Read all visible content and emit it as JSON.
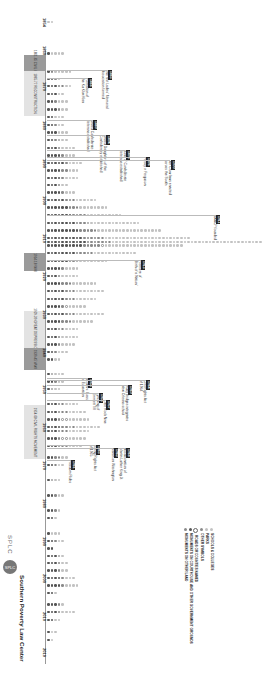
{
  "chart_data": {
    "type": "dot-timeline",
    "orientation": "rotated 90deg clockwise; year axis runs top-to-bottom, dot counts extend right",
    "xlabel": "Year",
    "ylabel": "Number of dedications",
    "x_range": [
      1854,
      2019
    ],
    "ticks": [
      "1854",
      "1860",
      "1870",
      "1880",
      "1890",
      "1900",
      "1910",
      "1920",
      "1930",
      "1940",
      "1950",
      "1960",
      "1970",
      "1980",
      "1990",
      "2000",
      "2010",
      "2019"
    ],
    "eras": [
      {
        "label": "1861-65 Civil War",
        "start": 1861,
        "end": 1865,
        "shade": "dark"
      },
      {
        "label": "1865-77 Reconstruction",
        "start": 1865,
        "end": 1877,
        "shade": "light"
      },
      {
        "label": "1914-18 WWI",
        "start": 1914,
        "end": 1918,
        "shade": "dark"
      },
      {
        "label": "1929-39 Great Depression",
        "start": 1929,
        "end": 1939,
        "shade": "light"
      },
      {
        "label": "1939-45 WWII",
        "start": 1939,
        "end": 1945,
        "shade": "dark"
      },
      {
        "label": "1954-68 Civil Rights Movement",
        "start": 1954,
        "end": 1968,
        "shade": "light"
      }
    ],
    "series": [
      {
        "name": "Schools and colleges",
        "color": "#c2c2c2"
      },
      {
        "name": "Parks",
        "color": "#c2c2c2"
      },
      {
        "name": "Other symbols",
        "color": "#8a8a8a"
      },
      {
        "name": "Roads or counties named",
        "color": "#ffffff"
      },
      {
        "name": "Monuments on courthouse and other government grounds",
        "color": "#555555"
      },
      {
        "name": "Monuments on other land",
        "color": "#8a8a8a"
      }
    ],
    "rows": [
      {
        "year": 1854,
        "dark": 0,
        "mid": 0,
        "light": 2,
        "open": 0
      },
      {
        "year": 1861,
        "dark": 1,
        "mid": 0,
        "light": 4,
        "open": 0
      },
      {
        "year": 1866,
        "dark": 1,
        "mid": 1,
        "light": 5,
        "open": 0
      },
      {
        "year": 1868,
        "dark": 2,
        "mid": 1,
        "light": 1,
        "open": 0
      },
      {
        "year": 1870,
        "dark": 3,
        "mid": 1,
        "light": 2,
        "open": 1
      },
      {
        "year": 1872,
        "dark": 3,
        "mid": 0,
        "light": 2,
        "open": 0
      },
      {
        "year": 1874,
        "dark": 2,
        "mid": 1,
        "light": 3,
        "open": 0
      },
      {
        "year": 1876,
        "dark": 3,
        "mid": 1,
        "light": 2,
        "open": 0
      },
      {
        "year": 1878,
        "dark": 2,
        "mid": 0,
        "light": 3,
        "open": 0
      },
      {
        "year": 1880,
        "dark": 2,
        "mid": 1,
        "light": 2,
        "open": 0
      },
      {
        "year": 1882,
        "dark": 3,
        "mid": 0,
        "light": 3,
        "open": 0
      },
      {
        "year": 1884,
        "dark": 2,
        "mid": 1,
        "light": 2,
        "open": 1
      },
      {
        "year": 1886,
        "dark": 3,
        "mid": 1,
        "light": 4,
        "open": 0
      },
      {
        "year": 1888,
        "dark": 4,
        "mid": 1,
        "light": 3,
        "open": 0
      },
      {
        "year": 1890,
        "dark": 5,
        "mid": 1,
        "light": 4,
        "open": 0
      },
      {
        "year": 1892,
        "dark": 4,
        "mid": 2,
        "light": 3,
        "open": 0
      },
      {
        "year": 1894,
        "dark": 4,
        "mid": 1,
        "light": 4,
        "open": 0
      },
      {
        "year": 1896,
        "dark": 3,
        "mid": 1,
        "light": 2,
        "open": 0
      },
      {
        "year": 1898,
        "dark": 4,
        "mid": 1,
        "light": 3,
        "open": 0
      },
      {
        "year": 1900,
        "dark": 5,
        "mid": 2,
        "light": 6,
        "open": 1
      },
      {
        "year": 1902,
        "dark": 6,
        "mid": 2,
        "light": 8,
        "open": 1
      },
      {
        "year": 1904,
        "dark": 7,
        "mid": 3,
        "light": 10,
        "open": 1
      },
      {
        "year": 1906,
        "dark": 8,
        "mid": 3,
        "light": 14,
        "open": 1
      },
      {
        "year": 1908,
        "dark": 9,
        "mid": 4,
        "light": 18,
        "open": 1
      },
      {
        "year": 1910,
        "dark": 10,
        "mid": 5,
        "light": 24,
        "open": 1
      },
      {
        "year": 1911,
        "dark": 11,
        "mid": 6,
        "light": 48,
        "open": 1
      },
      {
        "year": 1912,
        "dark": 10,
        "mid": 5,
        "light": 22,
        "open": 1
      },
      {
        "year": 1914,
        "dark": 8,
        "mid": 4,
        "light": 12,
        "open": 1
      },
      {
        "year": 1916,
        "dark": 6,
        "mid": 2,
        "light": 8,
        "open": 1
      },
      {
        "year": 1918,
        "dark": 4,
        "mid": 1,
        "light": 4,
        "open": 0
      },
      {
        "year": 1920,
        "dark": 3,
        "mid": 1,
        "light": 5,
        "open": 0
      },
      {
        "year": 1922,
        "dark": 4,
        "mid": 2,
        "light": 7,
        "open": 1
      },
      {
        "year": 1924,
        "dark": 5,
        "mid": 2,
        "light": 8,
        "open": 1
      },
      {
        "year": 1926,
        "dark": 5,
        "mid": 2,
        "light": 6,
        "open": 1
      },
      {
        "year": 1928,
        "dark": 4,
        "mid": 1,
        "light": 5,
        "open": 1
      },
      {
        "year": 1930,
        "dark": 5,
        "mid": 2,
        "light": 8,
        "open": 1
      },
      {
        "year": 1932,
        "dark": 4,
        "mid": 2,
        "light": 6,
        "open": 1
      },
      {
        "year": 1934,
        "dark": 3,
        "mid": 1,
        "light": 4,
        "open": 1
      },
      {
        "year": 1936,
        "dark": 3,
        "mid": 1,
        "light": 5,
        "open": 0
      },
      {
        "year": 1938,
        "dark": 3,
        "mid": 1,
        "light": 4,
        "open": 0
      },
      {
        "year": 1940,
        "dark": 2,
        "mid": 1,
        "light": 3,
        "open": 0
      },
      {
        "year": 1942,
        "dark": 2,
        "mid": 0,
        "light": 2,
        "open": 0
      },
      {
        "year": 1946,
        "dark": 1,
        "mid": 0,
        "light": 3,
        "open": 1
      },
      {
        "year": 1948,
        "dark": 2,
        "mid": 1,
        "light": 2,
        "open": 0
      },
      {
        "year": 1950,
        "dark": 1,
        "mid": 0,
        "light": 2,
        "open": 1
      },
      {
        "year": 1954,
        "dark": 3,
        "mid": 1,
        "light": 4,
        "open": 1
      },
      {
        "year": 1956,
        "dark": 3,
        "mid": 1,
        "light": 5,
        "open": 2
      },
      {
        "year": 1958,
        "dark": 3,
        "mid": 1,
        "light": 6,
        "open": 2
      },
      {
        "year": 1960,
        "dark": 4,
        "mid": 2,
        "light": 7,
        "open": 2
      },
      {
        "year": 1961,
        "dark": 3,
        "mid": 1,
        "light": 6,
        "open": 2
      },
      {
        "year": 1963,
        "dark": 3,
        "mid": 1,
        "light": 5,
        "open": 2
      },
      {
        "year": 1965,
        "dark": 3,
        "mid": 1,
        "light": 4,
        "open": 2
      },
      {
        "year": 1968,
        "dark": 2,
        "mid": 1,
        "light": 2,
        "open": 1
      },
      {
        "year": 1970,
        "dark": 2,
        "mid": 0,
        "light": 2,
        "open": 1
      },
      {
        "year": 1974,
        "dark": 1,
        "mid": 0,
        "light": 2,
        "open": 1
      },
      {
        "year": 1978,
        "dark": 2,
        "mid": 1,
        "light": 2,
        "open": 0
      },
      {
        "year": 1982,
        "dark": 2,
        "mid": 1,
        "light": 1,
        "open": 0
      },
      {
        "year": 1984,
        "dark": 2,
        "mid": 0,
        "light": 1,
        "open": 0
      },
      {
        "year": 1988,
        "dark": 1,
        "mid": 0,
        "light": 3,
        "open": 0
      },
      {
        "year": 1990,
        "dark": 2,
        "mid": 1,
        "light": 2,
        "open": 0
      },
      {
        "year": 1992,
        "dark": 2,
        "mid": 0,
        "light": 0,
        "open": 0
      },
      {
        "year": 1994,
        "dark": 3,
        "mid": 0,
        "light": 1,
        "open": 1
      },
      {
        "year": 1996,
        "dark": 3,
        "mid": 1,
        "light": 2,
        "open": 0
      },
      {
        "year": 1998,
        "dark": 3,
        "mid": 1,
        "light": 2,
        "open": 0
      },
      {
        "year": 2000,
        "dark": 4,
        "mid": 1,
        "light": 3,
        "open": 0
      },
      {
        "year": 2002,
        "dark": 4,
        "mid": 1,
        "light": 4,
        "open": 0
      },
      {
        "year": 2004,
        "dark": 2,
        "mid": 0,
        "light": 1,
        "open": 0
      },
      {
        "year": 2007,
        "dark": 3,
        "mid": 1,
        "light": 1,
        "open": 0
      },
      {
        "year": 2009,
        "dark": 3,
        "mid": 1,
        "light": 4,
        "open": 0
      },
      {
        "year": 2011,
        "dark": 2,
        "mid": 0,
        "light": 2,
        "open": 0
      },
      {
        "year": 2014,
        "dark": 1,
        "mid": 0,
        "light": 2,
        "open": 0
      },
      {
        "year": 2016,
        "dark": 1,
        "mid": 0,
        "light": 1,
        "open": 0
      }
    ],
    "annotations": [
      {
        "year": "1865",
        "text": "The first Ladies' Memorial Association formed"
      },
      {
        "year": "1866",
        "text": "Formation of the Ku Klux Klan"
      },
      {
        "year": "1889",
        "text": "United Confederate Veterans established"
      },
      {
        "year": "1894",
        "text": "United Daughters of the Confederacy established"
      },
      {
        "year": "1896",
        "text": "Sons of Confederate Veterans established"
      },
      {
        "year": "1896",
        "text": "Plessy v. Ferguson"
      },
      {
        "year": "1900",
        "text": "Jim Crow laws enacted across the South"
      },
      {
        "year": "1911",
        "text": "NAACP founded"
      },
      {
        "year": "1915",
        "text": "Premiere of 'Birth of a Nation'"
      },
      {
        "year": "1954",
        "text": "Brown v. Board of Education"
      },
      {
        "year": "1955",
        "text": "Lynching of Emmett Till"
      },
      {
        "year": "1957",
        "text": "Little Rock Nine"
      },
      {
        "year": "1960",
        "text": "Ruby Bridges integrates New Orleans school"
      },
      {
        "year": "1961",
        "text": "Freedom Rides"
      },
      {
        "year": "1963",
        "text": "March on Washington; 'I Have a Dream'"
      },
      {
        "year": "1964",
        "text": "Civil Rights Act of 1964"
      },
      {
        "year": "1965",
        "text": "Voting Rights Act of 1965"
      },
      {
        "year": "1968",
        "text": "Assassination of Martin Luther King Jr."
      }
    ]
  },
  "axis": {
    "ticks": [
      {
        "label": "1854",
        "y": 22
      },
      {
        "label": "1860",
        "y": 50
      },
      {
        "label": "1870",
        "y": 86
      },
      {
        "label": "1880",
        "y": 125
      },
      {
        "label": "1890",
        "y": 163
      },
      {
        "label": "1900",
        "y": 200
      },
      {
        "label": "1910",
        "y": 238
      },
      {
        "label": "1920",
        "y": 276
      },
      {
        "label": "1930",
        "y": 314
      },
      {
        "label": "1940",
        "y": 352
      },
      {
        "label": "1950",
        "y": 389
      },
      {
        "label": "1960",
        "y": 427
      },
      {
        "label": "1970",
        "y": 465
      },
      {
        "label": "1980",
        "y": 503
      },
      {
        "label": "1990",
        "y": 541
      },
      {
        "label": "2000",
        "y": 578
      },
      {
        "label": "2010",
        "y": 616
      },
      {
        "label": "2019",
        "y": 652
      }
    ]
  },
  "eras": [
    {
      "label": "1861-65 CIVIL WAR",
      "top": 55,
      "height": 16,
      "shade": "dark"
    },
    {
      "label": "1865-77 RECONSTRUCTION",
      "top": 71,
      "height": 45,
      "shade": "light"
    },
    {
      "label": "1914-18 WWI",
      "top": 253,
      "height": 18,
      "shade": "dark"
    },
    {
      "label": "1929-39 GREAT DEPRESSION",
      "top": 311,
      "height": 37,
      "shade": "light"
    },
    {
      "label": "1939-45 WWII",
      "top": 348,
      "height": 22,
      "shade": "dark"
    },
    {
      "label": "1954-68 CIVIL RIGHTS MOVEMENT",
      "top": 405,
      "height": 54,
      "shade": "light"
    }
  ],
  "notes": [
    {
      "year": "1865",
      "text": "The first Ladies' Memorial",
      "text2": "Association formed",
      "x": 112,
      "y": 70
    },
    {
      "year": "1866",
      "text": "Formation of",
      "text2": "the Ku Klux Klan",
      "x": 92,
      "y": 78
    },
    {
      "year": "1889",
      "text": "United Confederate",
      "text2": "Veterans established",
      "x": 97,
      "y": 120
    },
    {
      "year": "1894",
      "text": "United Daughters of the",
      "text2": "Confederacy established",
      "x": 110,
      "y": 135
    },
    {
      "year": "1896",
      "text": "Sons of Confederate",
      "text2": "Veterans established",
      "x": 130,
      "y": 150
    },
    {
      "year": "1896",
      "text": "Plessy v. Ferguson",
      "text2": "",
      "x": 150,
      "y": 157
    },
    {
      "year": "1900",
      "text": "Jim Crow laws enacted",
      "text2": "across the South",
      "x": 175,
      "y": 160
    },
    {
      "year": "1911",
      "text": "NAACP founded",
      "text2": "",
      "x": 220,
      "y": 215
    },
    {
      "year": "1915",
      "text": "Premiere of",
      "text2": "'Birth of a Nation'",
      "x": 145,
      "y": 260
    },
    {
      "year": "1954",
      "text": "Brown v. Board",
      "text2": "of Education",
      "x": 92,
      "y": 378
    },
    {
      "year": "1955",
      "text": "Lynching of",
      "text2": "Emmett Till",
      "x": 103,
      "y": 393
    },
    {
      "year": "1957",
      "text": "Little Rock Nine",
      "text2": "",
      "x": 110,
      "y": 400
    },
    {
      "year": "1960",
      "text": "Ruby Bridges integrates",
      "text2": "New Orleans school",
      "x": 132,
      "y": 385
    },
    {
      "year": "1964",
      "text": "Civil Rights Act",
      "text2": "of 1964",
      "x": 150,
      "y": 380
    },
    {
      "year": "1965",
      "text": "Voting Rights Act",
      "text2": "of 1965",
      "x": 100,
      "y": 445
    },
    {
      "year": "1968",
      "text": "Assassination of",
      "text2": "Martin Luther King Jr.",
      "x": 130,
      "y": 448
    },
    {
      "year": "1963",
      "text": "March on Washington",
      "text2": "",
      "x": 118,
      "y": 448
    },
    {
      "year": "1961",
      "text": "Freedom Rides",
      "text2": "",
      "x": 75,
      "y": 460
    }
  ],
  "legend": {
    "items": [
      {
        "label": "SCHOOLS & COLLEGES",
        "color": "#c2c2c2"
      },
      {
        "label": "PARKS",
        "color": "#c2c2c2"
      },
      {
        "label": "OTHER SYMBOLS",
        "color": "#8a8a8a"
      },
      {
        "label": "ROADS OR COUNTIES NAMED",
        "color": "#ffffff"
      },
      {
        "label": "MONUMENTS ON COURTHOUSE AND OTHER GOVERNMENT GROUNDS",
        "color": "#555555"
      },
      {
        "label": "MONUMENTS ON OTHER LAND",
        "color": "#8a8a8a"
      }
    ]
  },
  "logo": {
    "abbr": "SPLC",
    "circle_text": "SPLC",
    "name": "Southern Poverty Law Center"
  }
}
